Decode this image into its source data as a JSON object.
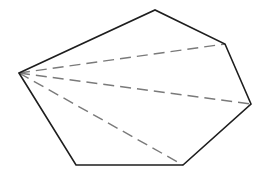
{
  "diagram": {
    "width": 265,
    "height": 176,
    "colors": {
      "background": "#ffffff",
      "edge": "#1e1e1e",
      "diagonal": "#7a7a7a"
    },
    "stroke": {
      "edge_width": 1.6,
      "diagonal_width": 1.4,
      "dash": "11 6"
    },
    "vertices": [
      {
        "id": "A",
        "x": 19,
        "y": 73
      },
      {
        "id": "B",
        "x": 155,
        "y": 10
      },
      {
        "id": "C",
        "x": 225,
        "y": 44
      },
      {
        "id": "D",
        "x": 251,
        "y": 104
      },
      {
        "id": "E",
        "x": 183,
        "y": 165
      },
      {
        "id": "F",
        "x": 76,
        "y": 165
      }
    ],
    "edges": [
      {
        "from": "A",
        "to": "B"
      },
      {
        "from": "B",
        "to": "C"
      },
      {
        "from": "C",
        "to": "D"
      },
      {
        "from": "D",
        "to": "E"
      },
      {
        "from": "E",
        "to": "F"
      },
      {
        "from": "F",
        "to": "A"
      }
    ],
    "diagonals": [
      {
        "from": "A",
        "to": "C"
      },
      {
        "from": "A",
        "to": "D"
      },
      {
        "from": "A",
        "to": "E"
      }
    ]
  }
}
